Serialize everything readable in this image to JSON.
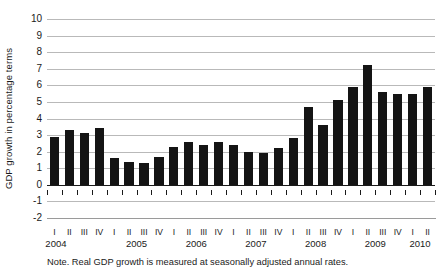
{
  "chart_data": {
    "type": "bar",
    "title": "",
    "subtitle": "",
    "xlabel": "",
    "ylabel": "GDP growth in percentage terms",
    "ylim": [
      -2,
      10
    ],
    "yticks": [
      10,
      9,
      8,
      7,
      6,
      5,
      4,
      3,
      2,
      1,
      0,
      -1,
      -2
    ],
    "ytick_labels": [
      "10",
      "9",
      "8",
      "7",
      "6",
      "5",
      "4",
      "3",
      "2",
      "1",
      "0",
      "-1",
      "-2"
    ],
    "grid": true,
    "legend": null,
    "note": "Note. Real GDP growth is measured at seasonally adjusted annual rates.",
    "bar_color": "#141414",
    "gridline_color": "#b9b9b9",
    "axis_color": "#1a1a1a",
    "years": [
      "2004",
      "2005",
      "2006",
      "2007",
      "2008",
      "2009",
      "2010"
    ],
    "quarter_labels": [
      "I",
      "II",
      "III",
      "IV",
      "I",
      "II",
      "III",
      "IV",
      "I",
      "II",
      "III",
      "IV",
      "I",
      "II",
      "III",
      "IV",
      "I",
      "II",
      "III",
      "IV",
      "I",
      "II",
      "III",
      "IV",
      "I",
      "II"
    ],
    "categories": [
      "2004 I",
      "2004 II",
      "2004 III",
      "2004 IV",
      "2005 I",
      "2005 II",
      "2005 III",
      "2005 IV",
      "2006 I",
      "2006 II",
      "2006 III",
      "2006 IV",
      "2007 I",
      "2007 II",
      "2007 III",
      "2007 IV",
      "2008 I",
      "2008 II",
      "2008 III",
      "2008 IV",
      "2009 I",
      "2009 II",
      "2009 III",
      "2009 IV",
      "2010 I",
      "2010 II"
    ],
    "values": [
      2.9,
      3.3,
      3.1,
      3.4,
      1.6,
      1.4,
      1.3,
      1.7,
      2.3,
      2.6,
      2.4,
      2.6,
      2.4,
      2.0,
      1.9,
      2.2,
      2.8,
      4.7,
      3.6,
      5.1,
      5.9,
      7.2,
      5.6,
      5.5,
      5.5,
      5.9
    ],
    "year_start_index": [
      0,
      4,
      8,
      12,
      16,
      20,
      24
    ]
  }
}
